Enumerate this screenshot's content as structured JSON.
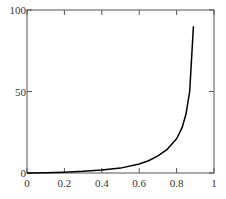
{
  "chart_data": {
    "type": "line",
    "title": "",
    "xlabel": "",
    "ylabel": "",
    "xlim": [
      0,
      1
    ],
    "ylim": [
      0,
      100
    ],
    "grid": false,
    "legend": null,
    "x_ticks": [
      "0",
      "0.2",
      "0.4",
      "0.6",
      "0.8",
      "1"
    ],
    "y_ticks": [
      "0",
      "50",
      "100"
    ],
    "series": [
      {
        "name": "curve",
        "color": "#000000",
        "x": [
          0,
          0.1,
          0.2,
          0.3,
          0.4,
          0.5,
          0.6,
          0.65,
          0.7,
          0.75,
          0.8,
          0.83,
          0.85,
          0.87,
          0.89
        ],
        "values": [
          0,
          0.2,
          0.5,
          1.0,
          1.8,
          3.0,
          5.5,
          7.5,
          10.5,
          14.5,
          21,
          28,
          36,
          50,
          90
        ]
      }
    ]
  },
  "axes": {
    "x_tick_labels": [
      "0",
      "0.2",
      "0.4",
      "0.6",
      "0.8",
      "1"
    ],
    "y_tick_labels": [
      "0",
      "50",
      "100"
    ]
  }
}
